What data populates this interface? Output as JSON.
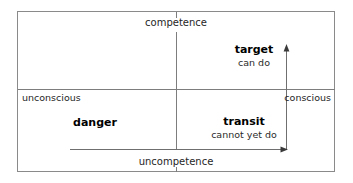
{
  "diagram": {
    "axes": {
      "vertical_top_label": "competence",
      "horizontal_bottom_label": "uncompetence",
      "left_label": "unconscious",
      "right_label": "conscious"
    },
    "quadrants": [
      {
        "key": "target",
        "title": "target",
        "subtitle": "can do",
        "position": "upper-right"
      },
      {
        "key": "danger",
        "title": "danger",
        "subtitle": "",
        "position": "lower-left"
      },
      {
        "key": "transit",
        "title": "transit",
        "subtitle": "cannot yet do",
        "position": "lower-right"
      }
    ],
    "arrows": [
      {
        "key": "vertical-up-arrow",
        "direction": "up",
        "description": "upward arrow at right side rising from bottom axis"
      },
      {
        "key": "horizontal-right-arrow",
        "direction": "right",
        "description": "rightward arrow along bottom axis"
      }
    ],
    "colors": {
      "frame": "#8a8a8a",
      "line": "#7d7d7d",
      "text": "#1a1a1a",
      "background": "#ffffff"
    }
  }
}
